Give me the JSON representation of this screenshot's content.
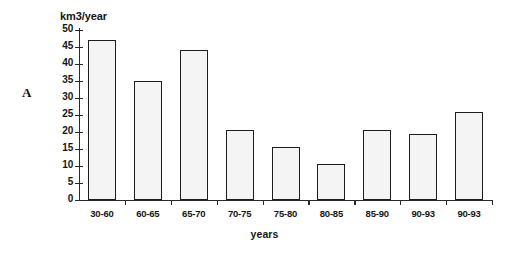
{
  "figure": {
    "panel_label": "A"
  },
  "chart_data": {
    "type": "bar",
    "title": "",
    "xlabel": "years",
    "ylabel": "km3/year",
    "categories": [
      "30-60",
      "60-65",
      "65-70",
      "70-75",
      "75-80",
      "80-85",
      "85-90",
      "90-93",
      "90-93"
    ],
    "values": [
      47,
      35,
      44,
      20.5,
      15.5,
      10.5,
      20.5,
      19.5,
      26
    ],
    "ylim": [
      0,
      50
    ],
    "ytick_labels": [
      "0",
      "5",
      "10",
      "15",
      "20",
      "25",
      "30",
      "35",
      "40",
      "45",
      "50"
    ],
    "ytick_values": [
      0,
      5,
      10,
      15,
      20,
      25,
      30,
      35,
      40,
      45,
      50
    ],
    "grid": false,
    "legend": "none",
    "bar_fill_color": "#f4f4f4",
    "bar_edge_color": "#1d1d1d",
    "axis_color": "#2b2b2b",
    "background_color": "#ffffff"
  }
}
